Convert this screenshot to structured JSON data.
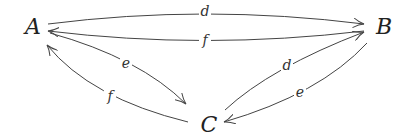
{
  "diagram": {
    "type": "commutative-diagram",
    "nodes": [
      {
        "id": "A",
        "label": "A"
      },
      {
        "id": "B",
        "label": "B"
      },
      {
        "id": "C",
        "label": "C"
      }
    ],
    "edges": [
      {
        "from": "A",
        "to": "B",
        "label": "d"
      },
      {
        "from": "B",
        "to": "A",
        "label": "f"
      },
      {
        "from": "A",
        "to": "C",
        "label": "e"
      },
      {
        "from": "C",
        "to": "A",
        "label": "f"
      },
      {
        "from": "C",
        "to": "B",
        "label": "d"
      },
      {
        "from": "B",
        "to": "C",
        "label": "e"
      }
    ]
  }
}
